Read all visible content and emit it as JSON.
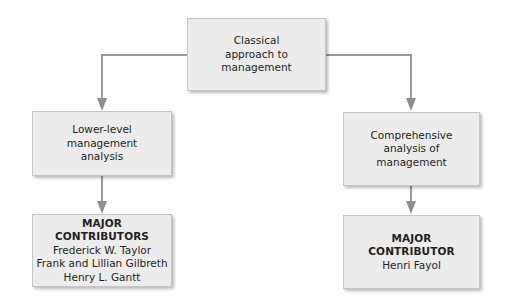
{
  "diagram": {
    "type": "flowchart",
    "colors": {
      "box_fill": "#ececec",
      "box_border": "#c4c4c4",
      "connector": "#9a9a9a",
      "text": "#231f20"
    },
    "root": {
      "lines": [
        "Classical",
        "approach to",
        "management"
      ]
    },
    "left_branch": {
      "analysis": {
        "lines": [
          "Lower-level",
          "management",
          "analysis"
        ]
      },
      "contributors": {
        "heading": [
          "MAJOR",
          "CONTRIBUTORS"
        ],
        "names": [
          "Frederick W. Taylor",
          "Frank and Lillian Gilbreth",
          "Henry L. Gantt"
        ]
      }
    },
    "right_branch": {
      "analysis": {
        "lines": [
          "Comprehensive",
          "analysis of",
          "management"
        ]
      },
      "contributors": {
        "heading": [
          "MAJOR",
          "CONTRIBUTOR"
        ],
        "names": [
          "Henri Fayol"
        ]
      }
    },
    "edges": [
      {
        "from": "Classical approach to management",
        "to": "Lower-level management analysis"
      },
      {
        "from": "Classical approach to management",
        "to": "Comprehensive analysis of management"
      },
      {
        "from": "Lower-level management analysis",
        "to": "MAJOR CONTRIBUTORS"
      },
      {
        "from": "Comprehensive analysis of management",
        "to": "MAJOR CONTRIBUTOR"
      }
    ]
  }
}
